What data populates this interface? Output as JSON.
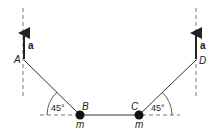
{
  "diagram": {
    "points": {
      "A": "A",
      "B": "B",
      "C": "C",
      "D": "D"
    },
    "masses": {
      "B": "m",
      "C": "m"
    },
    "acceleration_label": "a",
    "angle_left": "45°",
    "angle_right": "45°",
    "colors": {
      "line": "#333333",
      "mass": "#111111",
      "dash": "#555555"
    }
  }
}
